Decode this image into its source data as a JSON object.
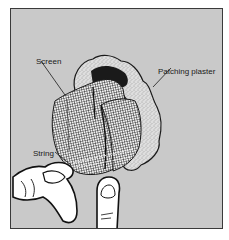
{
  "figure": {
    "background_color": "#c9c9c9",
    "border_color": "#3a3a3a",
    "labels": {
      "screen": "Screen",
      "patching_plaster": "Patching plaster",
      "string": "String"
    }
  }
}
